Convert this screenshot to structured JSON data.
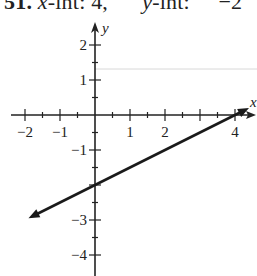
{
  "caption": {
    "number": "51.",
    "x_int_label": "x",
    "x_int_text": "-int: 4,",
    "y_int_label": "y",
    "y_int_text": "-int: ",
    "y_int_value": "−2"
  },
  "chart_data": {
    "type": "line",
    "xlabel": "x",
    "ylabel": "y",
    "xlim": [
      -2.4,
      4.6
    ],
    "ylim": [
      -4.6,
      2.7
    ],
    "x_ticks": [
      -2,
      -1,
      1,
      2,
      4
    ],
    "x_tick_labels": [
      "−2",
      "−1",
      "1",
      "2",
      "4"
    ],
    "y_ticks": [
      2,
      1,
      -1,
      -3,
      -4
    ],
    "y_tick_labels": [
      "2",
      "1",
      "−1",
      "−3",
      "−4"
    ],
    "grid": false,
    "series": [
      {
        "name": "y = 0.5x - 2",
        "x": [
          -1.9,
          0,
          4,
          4.4
        ],
        "y": [
          -2.95,
          -2,
          0,
          0.2
        ],
        "arrows": "both"
      }
    ],
    "intercepts": {
      "x_intercept": 4,
      "y_intercept": -2
    }
  }
}
